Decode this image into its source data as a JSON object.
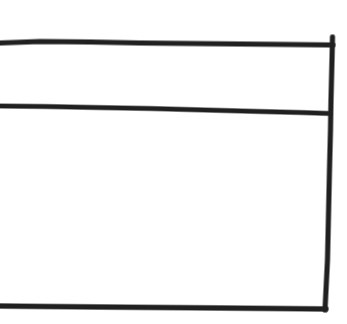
{
  "canvas": {
    "width": 347,
    "height": 324,
    "background_color": "#ffffff",
    "ink_color": "#141414"
  },
  "figure": {
    "style": "freehand pen sketch",
    "stroke_width_px": 4,
    "regions": [
      {
        "name": "header-row",
        "label": "",
        "x": 0,
        "y": 46,
        "width": 330,
        "height": 60
      },
      {
        "name": "body-row",
        "label": "",
        "x": 0,
        "y": 114,
        "width": 326,
        "height": 191
      }
    ]
  },
  "strokes": {
    "top_border": {
      "name": "top-horizontal-line",
      "path": "M 0,43 L 40,41.5 L 90,42 L 140,43 L 190,43.5 L 240,44 L 290,44.5 L 333,45",
      "width": 4.2
    },
    "divider": {
      "name": "middle-horizontal-divider",
      "path": "M 0,106 L 45,106.5 L 95,107.5 L 150,108.5 L 205,110 L 260,111.5 L 300,112.5 L 330,113.5",
      "width": 3.8
    },
    "bottom_border": {
      "name": "bottom-horizontal-line",
      "path": "M 0,306 L 45,306.5 L 100,307 L 160,307.5 L 220,308 L 275,308.5 L 326,309",
      "width": 4.4
    },
    "right_border": {
      "name": "right-vertical-line",
      "path": "M 332.5,37 L 332,60 L 331,100 L 330.5,130 L 329.5,170 L 328.5,215 L 327.5,260 L 326,290 L 325,310",
      "width": 4.2
    }
  }
}
